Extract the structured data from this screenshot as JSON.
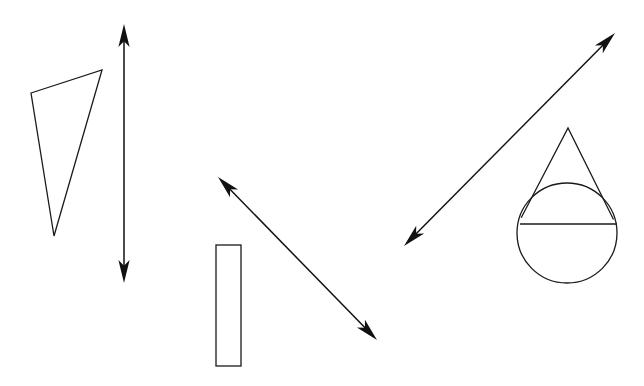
{
  "figure": {
    "title": "Geometric shapes and double-headed arrows diagram",
    "background_color": "#ffffff",
    "stroke_color": "#1a1a1a",
    "arrow_color": "#111111",
    "canvas": {
      "width": 644,
      "height": 386
    },
    "shapes": [
      {
        "id": "scalene-triangle",
        "name": "scalene-triangle",
        "type": "polygon",
        "label": "Triangle",
        "points": "31,93 102,70 54,236",
        "vertices": [
          [
            31,
            93
          ],
          [
            102,
            70
          ],
          [
            54,
            236
          ]
        ]
      },
      {
        "id": "tall-rectangle",
        "name": "tall-rectangle",
        "type": "rect",
        "label": "Rectangle",
        "x": 216,
        "y": 245,
        "width": 25,
        "height": 121
      },
      {
        "id": "drop-shape",
        "name": "drop-shape",
        "type": "composite",
        "label": "Drop shape (triangle over circle)",
        "circle": {
          "cx": 567,
          "cy": 233,
          "r": 50
        },
        "triangle_apex": [
          568,
          128
        ],
        "triangle_left": [
          521,
          224
        ],
        "triangle_right": [
          614,
          224
        ],
        "chord_y": 224
      }
    ],
    "arrows": [
      {
        "id": "vertical-arrow",
        "name": "vertical-double-arrow",
        "label": "Vertical double-headed arrow",
        "x1": 124,
        "y1": 24,
        "x2": 124,
        "y2": 283,
        "double_headed": true
      },
      {
        "id": "diagonal-arrow-down-right",
        "name": "diagonal-double-arrow-down-right",
        "label": "Diagonal double-headed arrow pointing up-left and down-right",
        "x1": 218,
        "y1": 177,
        "x2": 377,
        "y2": 340,
        "double_headed": true
      },
      {
        "id": "diagonal-arrow-up-right",
        "name": "diagonal-double-arrow-up-right",
        "label": "Diagonal double-headed arrow pointing down-left and up-right",
        "x1": 404,
        "y1": 246,
        "x2": 615,
        "y2": 33,
        "double_headed": true
      }
    ]
  }
}
